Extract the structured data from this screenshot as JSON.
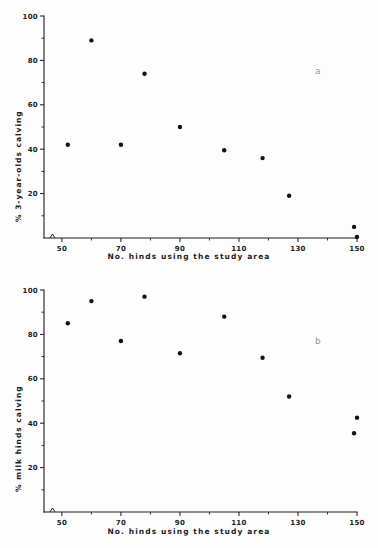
{
  "figure": {
    "panels": [
      {
        "id": "a",
        "label": "a",
        "xlabel": "No. hinds using the study area",
        "ylabel": "% 3-year-olds calving"
      },
      {
        "id": "b",
        "label": "b",
        "xlabel": "No. hinds using the study area",
        "ylabel": "% milk hinds calving"
      }
    ]
  },
  "chart_data": [
    {
      "type": "scatter",
      "id": "a",
      "title": "",
      "panel_label": "a",
      "xlabel": "No. hinds using the study area",
      "ylabel": "% 3-year-olds calving",
      "xlim": [
        46,
        152
      ],
      "ylim": [
        0,
        100
      ],
      "axis_break_x": true,
      "grid": false,
      "legend": "none",
      "x_ticks_major": [
        50,
        70,
        90,
        110,
        130,
        150
      ],
      "x_tick_labels": [
        "50",
        "70",
        "90",
        "110",
        "130",
        "150"
      ],
      "x_ticks_minor": [
        60,
        80,
        100,
        120,
        140
      ],
      "y_ticks_major": [
        20,
        40,
        60,
        80,
        100
      ],
      "y_tick_labels": [
        "20",
        "40",
        "60",
        "80",
        "100"
      ],
      "y_ticks_minor": [
        10,
        30,
        50,
        70,
        90
      ],
      "points": [
        {
          "x": 52,
          "y": 42
        },
        {
          "x": 60,
          "y": 89
        },
        {
          "x": 70,
          "y": 42
        },
        {
          "x": 78,
          "y": 74
        },
        {
          "x": 90,
          "y": 50
        },
        {
          "x": 105,
          "y": 39.5
        },
        {
          "x": 118,
          "y": 36
        },
        {
          "x": 127,
          "y": 19
        },
        {
          "x": 149,
          "y": 5
        },
        {
          "x": 150,
          "y": 0.5
        }
      ]
    },
    {
      "type": "scatter",
      "id": "b",
      "title": "",
      "panel_label": "b",
      "xlabel": "No. hinds using the study area",
      "ylabel": "% milk hinds calving",
      "xlim": [
        46,
        152
      ],
      "ylim": [
        0,
        100
      ],
      "axis_break_x": true,
      "grid": false,
      "legend": "none",
      "x_ticks_major": [
        50,
        70,
        90,
        110,
        130,
        150
      ],
      "x_tick_labels": [
        "50",
        "70",
        "90",
        "110",
        "130",
        "150"
      ],
      "x_ticks_minor": [
        60,
        80,
        100,
        120,
        140
      ],
      "y_ticks_major": [
        20,
        40,
        60,
        80,
        100
      ],
      "y_tick_labels": [
        "20",
        "40",
        "60",
        "80",
        "100"
      ],
      "y_ticks_minor": [
        10,
        30,
        50,
        70,
        90
      ],
      "points": [
        {
          "x": 52,
          "y": 85
        },
        {
          "x": 60,
          "y": 95
        },
        {
          "x": 70,
          "y": 77
        },
        {
          "x": 78,
          "y": 97
        },
        {
          "x": 90,
          "y": 71.5
        },
        {
          "x": 105,
          "y": 88
        },
        {
          "x": 118,
          "y": 69.5
        },
        {
          "x": 127,
          "y": 52
        },
        {
          "x": 149,
          "y": 35.5
        },
        {
          "x": 150,
          "y": 42.5
        }
      ]
    }
  ]
}
